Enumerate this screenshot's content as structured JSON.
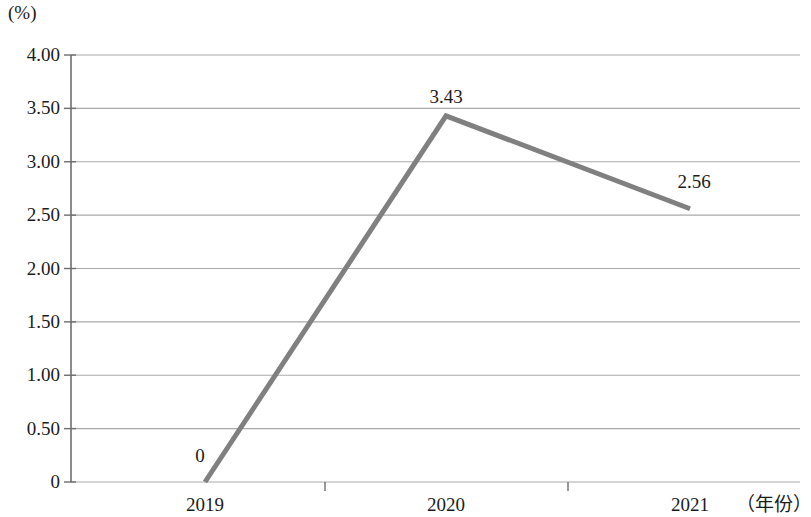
{
  "chart_data": {
    "type": "line",
    "title": "",
    "subtitle": "",
    "xlabel": "（年份）",
    "ylabel": "(%)",
    "categories": [
      "2019",
      "2020",
      "2021"
    ],
    "values": [
      0,
      3.43,
      2.56
    ],
    "point_labels": [
      "0",
      "3.43",
      "2.56"
    ],
    "series": [
      {
        "name": "",
        "values": [
          0,
          3.43,
          2.56
        ],
        "color": "#808080"
      }
    ],
    "ylim": [
      0,
      4.0
    ],
    "ytick_values": [
      4.0,
      3.5,
      3.0,
      2.5,
      2.0,
      1.5,
      1.0,
      0.5,
      0
    ],
    "ytick_labels": [
      "4.00",
      "3.50",
      "3.00",
      "2.50",
      "2.00",
      "1.50",
      "1.00",
      "0.50",
      "0"
    ],
    "grid": true,
    "grid_axis": "y",
    "grid_color": "#9a9a9a",
    "legend": false,
    "legend_position": "none",
    "line_color": "#808080",
    "line_width": 5,
    "axis_color": "#6e6e6e",
    "markers": false
  },
  "axis": {
    "unit_label": "(%)",
    "x_title": "（年份）"
  }
}
